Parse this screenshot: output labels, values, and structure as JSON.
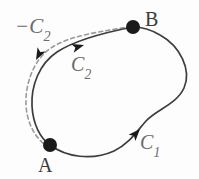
{
  "figure": {
    "kind": "math-contour-diagram",
    "background_color": "#fdfdfd",
    "width": 199,
    "height": 179
  },
  "labels": {
    "minus_c2": "−C",
    "minus_c2_sub": "2",
    "c2": "C",
    "c2_sub": "2",
    "c1": "C",
    "c1_sub": "1",
    "point_a": "A",
    "point_b": "B"
  },
  "colors": {
    "curve_solid": "#3d3d3d",
    "curve_dashed": "#9a9a9a",
    "point_fill": "#1a1a1a",
    "label_math": "#6b6b6b",
    "label_point": "#3a3a3a",
    "background": "#fdfdfd"
  },
  "points": [
    {
      "name": "A",
      "x": 50,
      "y": 145,
      "radius": 7
    },
    {
      "name": "B",
      "x": 133,
      "y": 27,
      "radius": 7
    }
  ],
  "paths": [
    {
      "name": "c2-upper-arc",
      "style": "solid",
      "direction": "A-to-B",
      "arrow_at": {
        "x": 83,
        "y": 45,
        "angle_deg": -18
      }
    },
    {
      "name": "minus-c2-dashed-arc",
      "style": "dashed",
      "direction": "B-to-A",
      "arrow_at": {
        "x": 40,
        "y": 56,
        "angle_deg": 112
      }
    },
    {
      "name": "c1-lower-arc",
      "style": "solid",
      "direction": "A-to-B",
      "arrow_at": {
        "x": 136,
        "y": 133,
        "angle_deg": -47
      }
    }
  ]
}
